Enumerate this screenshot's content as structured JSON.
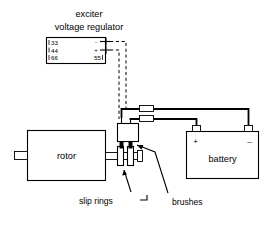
{
  "figure": {
    "title_line1": "exciter",
    "title_line2": "voltage regulator"
  },
  "regulator": {
    "name": "exciter voltage regulator",
    "terminals_left": [
      {
        "id": "33",
        "label": "33"
      },
      {
        "id": "44",
        "label": "44"
      },
      {
        "id": "66",
        "label": "66"
      }
    ],
    "terminals_right": [
      {
        "id": "55",
        "label": "55"
      }
    ],
    "polarity_minus": "-",
    "polarity_plus": "+"
  },
  "components": {
    "rotor_label": "rotor",
    "battery_label": "battery",
    "battery_positive": "+",
    "battery_negative": "–"
  },
  "callouts": {
    "slip_rings": "slip rings",
    "brushes": "brushes"
  },
  "colors": {
    "ink": "#000000",
    "paper": "#ffffff"
  }
}
